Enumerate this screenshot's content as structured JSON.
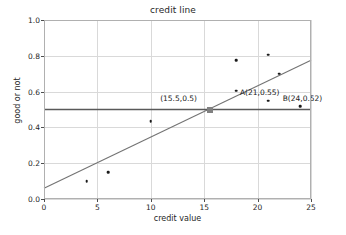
{
  "chart_data": {
    "type": "scatter",
    "title": "credit line",
    "xlabel": "credit value",
    "ylabel": "good or not",
    "xlim": [
      0,
      25
    ],
    "ylim": [
      0.0,
      1.0
    ],
    "xticks": [
      0,
      5,
      10,
      15,
      20,
      25
    ],
    "xtick_labels": [
      "0",
      "5",
      "10",
      "15",
      "20",
      "25"
    ],
    "yticks": [
      0.0,
      0.2,
      0.4,
      0.6,
      0.8,
      1.0
    ],
    "ytick_labels": [
      "0.0",
      "0.2",
      "0.4",
      "0.6",
      "0.8",
      "1.0"
    ],
    "grid": true,
    "legend": null,
    "series": [
      {
        "name": "data points",
        "type": "scatter",
        "color": "#1a1a1a",
        "points": [
          {
            "x": 4,
            "y": 0.1
          },
          {
            "x": 6,
            "y": 0.15
          },
          {
            "x": 10,
            "y": 0.435
          },
          {
            "x": 18,
            "y": 0.775
          },
          {
            "x": 18,
            "y": 0.605
          },
          {
            "x": 21,
            "y": 0.805
          },
          {
            "x": 21,
            "y": 0.55
          },
          {
            "x": 22,
            "y": 0.7
          },
          {
            "x": 24,
            "y": 0.52
          }
        ]
      },
      {
        "name": "regression line",
        "type": "line",
        "color": "#737373",
        "x": [
          0,
          25
        ],
        "y": [
          0.06,
          0.775
        ]
      },
      {
        "name": "threshold line",
        "type": "line",
        "color": "#595959",
        "x": [
          0,
          25
        ],
        "y": [
          0.5,
          0.5
        ]
      }
    ],
    "highlight_marker": {
      "x": 15.5,
      "y": 0.5,
      "color": "#808080",
      "shape": "square"
    },
    "annotations": [
      {
        "text": "(15.5,0.5)",
        "x": 15.5,
        "y": 0.5,
        "label_x": 12.6,
        "label_y": 0.565
      },
      {
        "text": "A(21,0.55)",
        "x": 21,
        "y": 0.55,
        "label_x": 20.2,
        "label_y": 0.6
      },
      {
        "text": "B(24,0.52)",
        "x": 24,
        "y": 0.52,
        "label_x": 24.2,
        "label_y": 0.565
      }
    ]
  }
}
